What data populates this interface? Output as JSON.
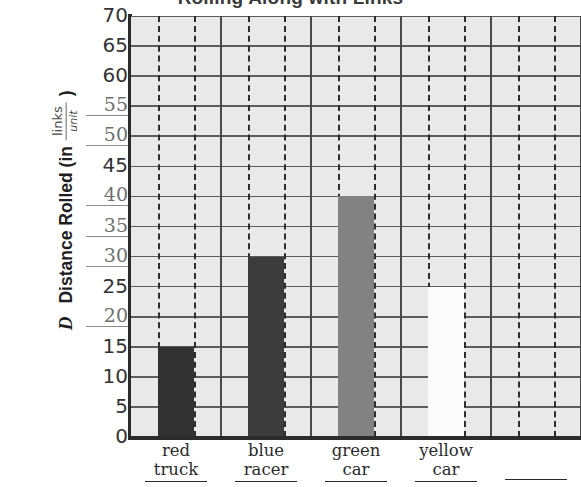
{
  "chart_data": {
    "type": "bar",
    "title": "Rolling Along with Links",
    "categories": [
      "red truck",
      "blue racer",
      "green car",
      "yellow car",
      ""
    ],
    "values": [
      15,
      30,
      40,
      25,
      null
    ],
    "bar_colors": [
      "#323232",
      "#3c3c3c",
      "#828282",
      "#fbfbfb",
      null
    ],
    "xlabel": "",
    "ylabel": "Distance Rolled (in",
    "ylabel_variable": "D",
    "ylabel_unit_numerator": "links",
    "ylabel_unit_denominator": "unit",
    "ylabel_suffix": ")",
    "ylim": [
      0,
      70
    ],
    "ytick_step": 5,
    "yticks": [
      70,
      65,
      60,
      55,
      50,
      45,
      40,
      35,
      30,
      25,
      20,
      15,
      10,
      5,
      0
    ],
    "grid": true,
    "grid_background": "#e9e9e9",
    "legend": "none"
  },
  "axis": {
    "y_tick_labels": [
      {
        "value": "70",
        "style": "normal"
      },
      {
        "value": "65",
        "style": "normal"
      },
      {
        "value": "60",
        "style": "normal"
      },
      {
        "value": "55",
        "style": "scribble"
      },
      {
        "value": "50",
        "style": "scribble"
      },
      {
        "value": "45",
        "style": "normal"
      },
      {
        "value": "40",
        "style": "scribble"
      },
      {
        "value": "35",
        "style": "scribble"
      },
      {
        "value": "30",
        "style": "scribble"
      },
      {
        "value": "25",
        "style": "normal"
      },
      {
        "value": "20",
        "style": "scribble"
      },
      {
        "value": "15",
        "style": "normal"
      },
      {
        "value": "10",
        "style": "normal"
      },
      {
        "value": "5",
        "style": "normal"
      },
      {
        "value": "0",
        "style": "normal"
      }
    ],
    "x_tick_labels": [
      {
        "line1": "red",
        "line2": "truck"
      },
      {
        "line1": "blue",
        "line2": "racer"
      },
      {
        "line1": "green",
        "line2": "car"
      },
      {
        "line1": "yellow",
        "line2": "car"
      },
      {
        "line1": "",
        "line2": ""
      }
    ]
  },
  "colors": {
    "plot_background": "#e9e9e9",
    "gridline": "#5c5c5c",
    "axis": "#2b2b2b",
    "dashed_guide": "#2e2e2e",
    "text": "#2a2a2a"
  }
}
